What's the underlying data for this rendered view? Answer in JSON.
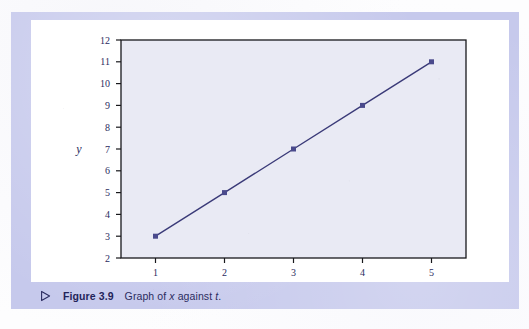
{
  "figure": {
    "caption_bullet_icon": "triangle-right-icon",
    "caption_number": "Figure 3.9",
    "caption_text_prefix": "Graph of ",
    "caption_var_1": "x",
    "caption_middle": " against ",
    "caption_var_2": "t",
    "caption_suffix": "."
  },
  "colors": {
    "frame": "#c6c9ec",
    "caption_band": "#c6c9ec",
    "plot_card": "#ffffff",
    "plot_background": "#e9eaf4",
    "axis": "#18181c",
    "series": "#3a3a78",
    "marker": "#4a4a8c",
    "tick_label": "#2b2c60",
    "caption_text": "#2b2c60"
  },
  "chart_data": {
    "type": "line",
    "title": "",
    "subtitle": "",
    "xlabel": "x",
    "ylabel": "y",
    "x": [
      1,
      2,
      3,
      4,
      5
    ],
    "values": [
      3,
      5,
      7,
      9,
      11
    ],
    "series": [
      {
        "name": "x against t",
        "values": [
          3,
          5,
          7,
          9,
          11
        ]
      }
    ],
    "xlim": [
      0.5,
      5.5
    ],
    "ylim": [
      2,
      12
    ],
    "xticks": [
      1,
      2,
      3,
      4,
      5
    ],
    "yticks": [
      2,
      3,
      4,
      5,
      6,
      7,
      8,
      9,
      10,
      11,
      12
    ],
    "xticklabels": [
      "1",
      "2",
      "3",
      "4",
      "5"
    ],
    "yticklabels": [
      "2",
      "3",
      "4",
      "5",
      "6",
      "7",
      "8",
      "9",
      "10",
      "11",
      "12"
    ],
    "grid": false,
    "legend": false,
    "legend_position": "none",
    "marker": "square",
    "marker_size": 5,
    "line_width": 1.4,
    "annotations": []
  }
}
